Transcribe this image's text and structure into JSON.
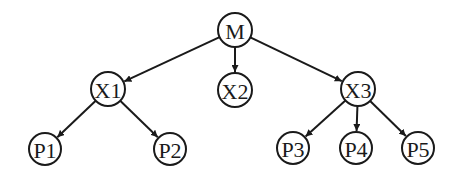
{
  "diagram": {
    "type": "tree",
    "colors": {
      "stroke": "#1a1a1a",
      "fill": "#ffffff",
      "background": "#ffffff"
    },
    "nodes": [
      {
        "id": "M",
        "label": "M",
        "x": 235,
        "y": 30,
        "r": 17
      },
      {
        "id": "X1",
        "label": "X1",
        "x": 108,
        "y": 89,
        "r": 17
      },
      {
        "id": "X2",
        "label": "X2",
        "x": 235,
        "y": 90,
        "r": 17
      },
      {
        "id": "X3",
        "label": "X3",
        "x": 358,
        "y": 89,
        "r": 17
      },
      {
        "id": "P1",
        "label": "P1",
        "x": 45,
        "y": 149,
        "r": 16
      },
      {
        "id": "P2",
        "label": "P2",
        "x": 170,
        "y": 149,
        "r": 16
      },
      {
        "id": "P3",
        "label": "P3",
        "x": 293,
        "y": 148,
        "r": 16
      },
      {
        "id": "P4",
        "label": "P4",
        "x": 356,
        "y": 148,
        "r": 16
      },
      {
        "id": "P5",
        "label": "P5",
        "x": 418,
        "y": 148,
        "r": 16
      }
    ],
    "edges": [
      {
        "from": "M",
        "to": "X1"
      },
      {
        "from": "M",
        "to": "X2"
      },
      {
        "from": "M",
        "to": "X3"
      },
      {
        "from": "X1",
        "to": "P1"
      },
      {
        "from": "X1",
        "to": "P2"
      },
      {
        "from": "X3",
        "to": "P3"
      },
      {
        "from": "X3",
        "to": "P4"
      },
      {
        "from": "X3",
        "to": "P5"
      }
    ]
  }
}
